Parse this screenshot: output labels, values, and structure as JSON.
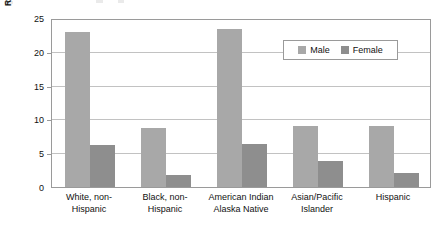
{
  "chart_data": {
    "type": "bar",
    "title": "",
    "xlabel": "",
    "ylabel": "Rate per 100,000 population",
    "ylim": [
      0,
      25
    ],
    "yticks": [
      0,
      5,
      10,
      15,
      20,
      25
    ],
    "ytick_labels": [
      "0",
      "5",
      "10",
      "15",
      "20",
      "25"
    ],
    "grid": true,
    "legend_position": "upper right",
    "categories": [
      "White, non-Hispanic",
      "Black, non-Hispanic",
      "American Indian Alaska Native",
      "Asian/Pacific Islander",
      "Hispanic"
    ],
    "category_lines": [
      [
        "White, non-",
        "Hispanic"
      ],
      [
        "Black, non-",
        "Hispanic"
      ],
      [
        "American Indian",
        "Alaska Native"
      ],
      [
        "Asian/Pacific",
        "Islander"
      ],
      [
        "Hispanic",
        ""
      ]
    ],
    "series": [
      {
        "name": "Male",
        "color": "#a8a8a8",
        "values": [
          23.0,
          8.8,
          23.4,
          9.0,
          9.0
        ]
      },
      {
        "name": "Female",
        "color": "#8e8e8e",
        "values": [
          6.2,
          1.8,
          6.3,
          3.8,
          2.0
        ]
      }
    ]
  },
  "legend": {
    "items": [
      {
        "label": "Male",
        "swatch": "male-swatch"
      },
      {
        "label": "Female",
        "swatch": "female-swatch"
      }
    ]
  },
  "axes": {
    "y_title": "Rate per 100,000 population"
  }
}
